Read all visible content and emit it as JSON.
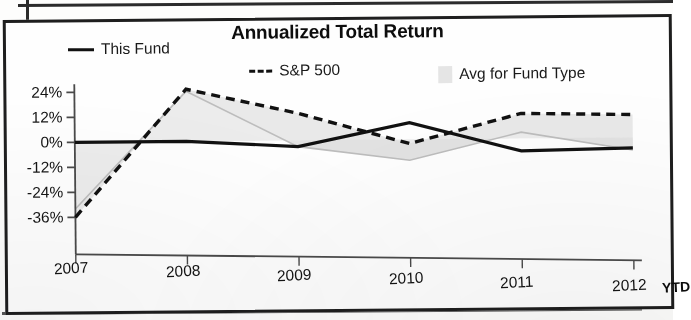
{
  "chart_data": {
    "type": "line",
    "title": "Annualized Total Return",
    "xlabel": "",
    "ylabel": "",
    "categories": [
      "2007",
      "2008",
      "2009",
      "2010",
      "2011",
      "2012"
    ],
    "x_axis_suffix": "YTD",
    "ytick_labels": [
      "24%",
      "12%",
      "0%",
      "-12%",
      "-24%",
      "-36%"
    ],
    "ytick_values": [
      24,
      12,
      0,
      -12,
      -24,
      -36
    ],
    "ylim": [
      -38,
      27
    ],
    "grid": false,
    "legend_position": "top",
    "series": [
      {
        "name": "This Fund",
        "style": "solid-line",
        "color": "#111111",
        "values": [
          0,
          0,
          -3,
          8,
          -6,
          -5
        ]
      },
      {
        "name": "S&P 500",
        "style": "dashed-line",
        "color": "#111111",
        "values": [
          -36,
          25,
          13,
          -2,
          12,
          11
        ]
      },
      {
        "name": "Avg for Fund Type",
        "style": "filled-area",
        "color": "#dcdcdc",
        "values": [
          -32,
          24,
          -3,
          -10,
          3,
          -6
        ]
      }
    ]
  },
  "legend": {
    "this_fund": "This Fund",
    "sp500": "S&P 500",
    "avg_fund_type": "Avg for Fund Type"
  },
  "colors": {
    "line": "#111111",
    "area_fill": "#dcdcdc",
    "axis": "#4a4a4a",
    "frame": "#1e1e1e",
    "text": "#141414"
  }
}
